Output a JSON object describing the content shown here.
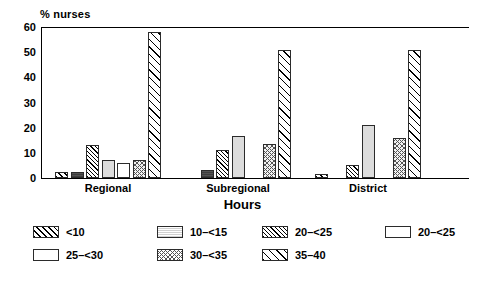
{
  "chart_data": {
    "type": "bar",
    "title": "",
    "ylabel": "% nurses",
    "xlabel": "Hours",
    "categories": [
      "Regional",
      "Subregional",
      "District"
    ],
    "ylim": [
      0,
      60
    ],
    "yticks": [
      0,
      10,
      20,
      30,
      40,
      50,
      60
    ],
    "grid": false,
    "legend_position": "bottom",
    "series": [
      {
        "name": "<10",
        "pattern": "diagonal-hatch-wide",
        "values": [
          2.5,
          0,
          1.5
        ]
      },
      {
        "name": "10–<15",
        "pattern": "solid-dark-gray",
        "values": [
          2.5,
          3,
          0
        ]
      },
      {
        "name": "20–<25",
        "pattern": "diagonal-hatch-fine",
        "values": [
          13,
          11,
          5
        ]
      },
      {
        "name": "20–<25",
        "pattern": "solid-light-gray",
        "values": [
          7,
          16.5,
          21
        ]
      },
      {
        "name": "25–<30",
        "pattern": "white",
        "values": [
          6,
          0,
          0
        ]
      },
      {
        "name": "30–<35",
        "pattern": "cross-hatch",
        "values": [
          7,
          13.5,
          16
        ]
      },
      {
        "name": "35–40",
        "pattern": "diagonal-hatch-broad",
        "values": [
          58,
          51,
          51
        ]
      }
    ]
  },
  "legend": {
    "items": [
      {
        "label": "<10"
      },
      {
        "label": "10–<15"
      },
      {
        "label": "20–<25"
      },
      {
        "label": "20–<25"
      },
      {
        "label": "25–<30"
      },
      {
        "label": "30–<35"
      },
      {
        "label": "35–40"
      }
    ]
  }
}
